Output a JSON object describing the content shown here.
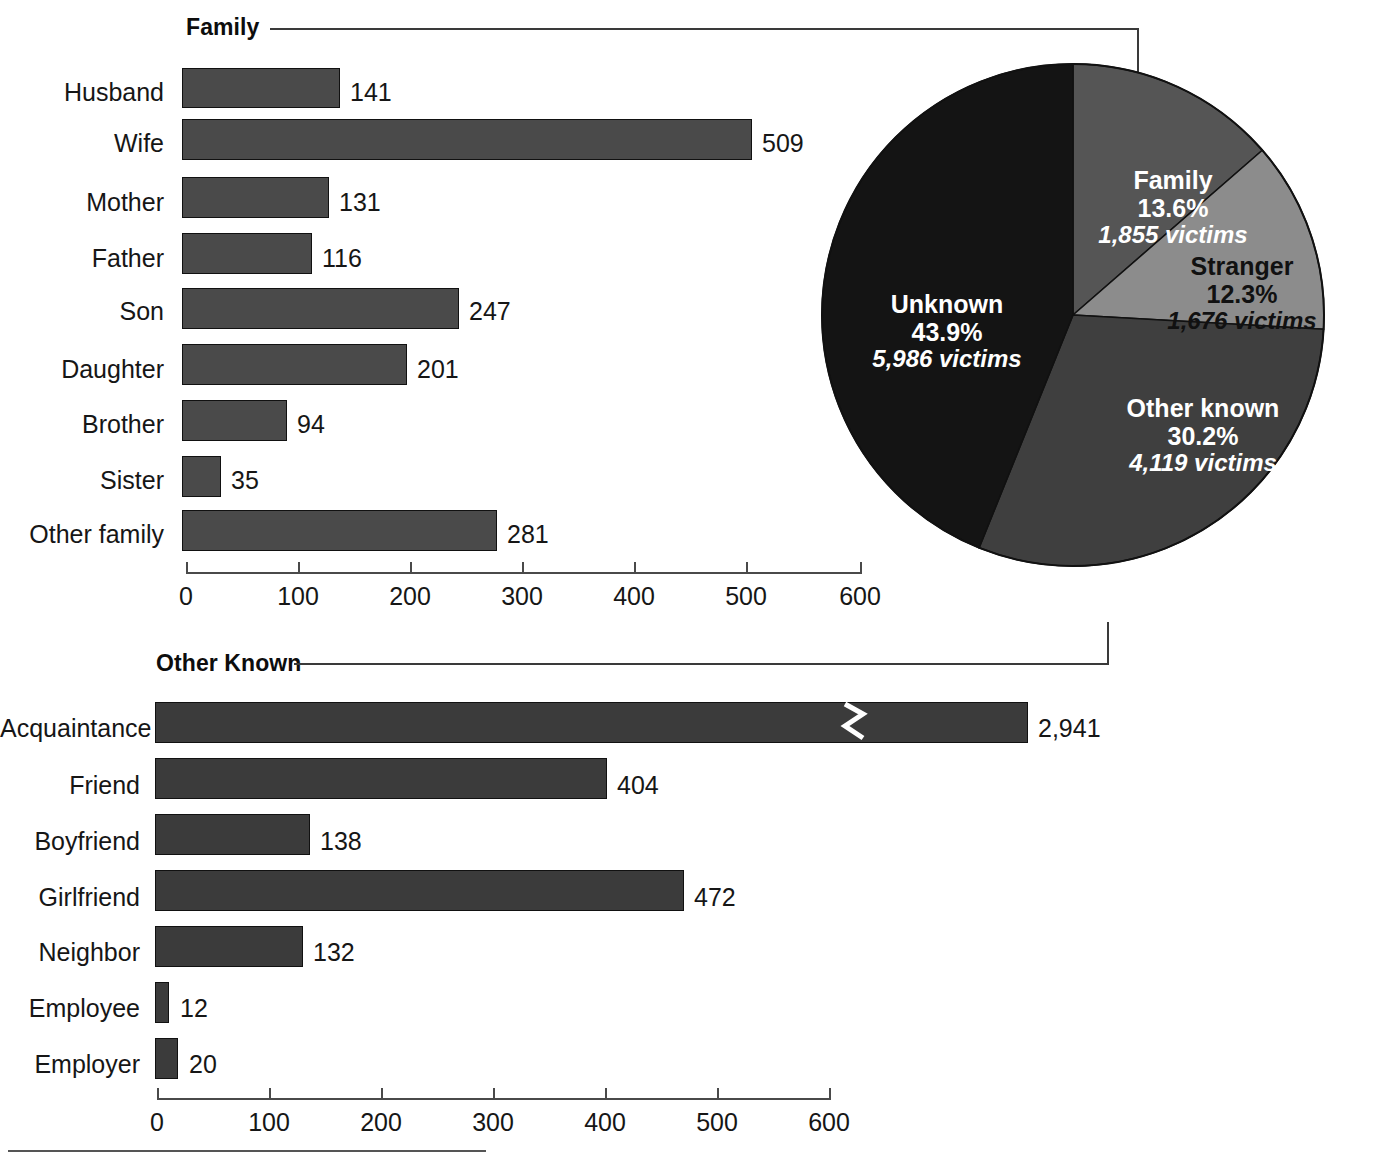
{
  "chart_data": [
    {
      "type": "bar",
      "orientation": "horizontal",
      "title": "Family",
      "categories": [
        "Husband",
        "Wife",
        "Mother",
        "Father",
        "Son",
        "Daughter",
        "Brother",
        "Sister",
        "Other family"
      ],
      "values": [
        141,
        509,
        131,
        116,
        247,
        201,
        94,
        35,
        281
      ],
      "value_labels": [
        "141",
        "509",
        "131",
        "116",
        "247",
        "201",
        "94",
        "35",
        "281"
      ],
      "xlabel": "",
      "ylabel": "",
      "xlim": [
        0,
        600
      ],
      "xticks": [
        0,
        100,
        200,
        300,
        400,
        500,
        600
      ],
      "xtick_labels": [
        "0",
        "100",
        "200",
        "300",
        "400",
        "500",
        "600"
      ],
      "grid": false,
      "legend": "none",
      "bar_color": "#4a4a4a"
    },
    {
      "type": "pie",
      "title": "",
      "categories": [
        "Family",
        "Stranger",
        "Other known",
        "Unknown"
      ],
      "values": [
        13.6,
        12.3,
        30.2,
        43.9
      ],
      "pct_labels": [
        "13.6%",
        "12.3%",
        "30.2%",
        "43.9%"
      ],
      "victim_labels": [
        "1,855 victims",
        "1,676 victims",
        "4,119 victims",
        "5,986 victims"
      ],
      "victim_counts": [
        1855,
        1676,
        4119,
        5986
      ],
      "slice_colors": [
        "#555555",
        "#8c8c8c",
        "#3f3f3f",
        "#141414"
      ],
      "legend": "none",
      "start_angle_deg": 0,
      "direction": "clockwise"
    },
    {
      "type": "bar",
      "orientation": "horizontal",
      "title": "Other Known",
      "categories": [
        "Acquaintance",
        "Friend",
        "Boyfriend",
        "Girlfriend",
        "Neighbor",
        "Employee",
        "Employer"
      ],
      "values": [
        2941,
        404,
        138,
        472,
        132,
        12,
        20
      ],
      "value_labels": [
        "2,941",
        "404",
        "138",
        "472",
        "132",
        "12",
        "20"
      ],
      "xlabel": "",
      "ylabel": "",
      "xlim": [
        0,
        600
      ],
      "xticks": [
        0,
        100,
        200,
        300,
        400,
        500,
        600
      ],
      "xtick_labels": [
        "0",
        "100",
        "200",
        "300",
        "400",
        "500",
        "600"
      ],
      "grid": false,
      "legend": "none",
      "bar_color": "#3b3b3b",
      "axis_break": {
        "series": "Acquaintance",
        "note": "broken bar (value exceeds axis)"
      }
    }
  ],
  "top_chart": {
    "title": "Family",
    "rows": [
      {
        "label": "Husband",
        "value": 141,
        "value_label": "141"
      },
      {
        "label": "Wife",
        "value": 509,
        "value_label": "509"
      },
      {
        "label": "Mother",
        "value": 131,
        "value_label": "131"
      },
      {
        "label": "Father",
        "value": 116,
        "value_label": "116"
      },
      {
        "label": "Son",
        "value": 247,
        "value_label": "247"
      },
      {
        "label": "Daughter",
        "value": 201,
        "value_label": "201"
      },
      {
        "label": "Brother",
        "value": 94,
        "value_label": "94"
      },
      {
        "label": "Sister",
        "value": 35,
        "value_label": "35"
      },
      {
        "label": "Other family",
        "value": 281,
        "value_label": "281"
      }
    ],
    "ticks": [
      "0",
      "100",
      "200",
      "300",
      "400",
      "500",
      "600"
    ]
  },
  "bottom_chart": {
    "title": "Other Known",
    "rows": [
      {
        "label": "Acquaintance",
        "value": 2941,
        "value_label": "2,941"
      },
      {
        "label": "Friend",
        "value": 404,
        "value_label": "404"
      },
      {
        "label": "Boyfriend",
        "value": 138,
        "value_label": "138"
      },
      {
        "label": "Girlfriend",
        "value": 472,
        "value_label": "472"
      },
      {
        "label": "Neighbor",
        "value": 132,
        "value_label": "132"
      },
      {
        "label": "Employee",
        "value": 12,
        "value_label": "12"
      },
      {
        "label": "Employer",
        "value": 20,
        "value_label": "20"
      }
    ],
    "ticks": [
      "0",
      "100",
      "200",
      "300",
      "400",
      "500",
      "600"
    ]
  },
  "pie": {
    "slices": [
      {
        "name": "Family",
        "percent": "13.6%",
        "victims": "1,855 victims"
      },
      {
        "name": "Stranger",
        "percent": "12.3%",
        "victims": "1,676 victims"
      },
      {
        "name": "Other known",
        "percent": "30.2%",
        "victims": "4,119 victims"
      },
      {
        "name": "Unknown",
        "percent": "43.9%",
        "victims": "5,986 victims"
      }
    ]
  },
  "colors": {
    "bar_light": "#4a4a4a",
    "bar_dark": "#3b3b3b",
    "pie_family": "#555555",
    "pie_stranger": "#8c8c8c",
    "pie_other_known": "#3f3f3f",
    "pie_unknown": "#141414",
    "text": "#161616",
    "rule": "#4a4a4a"
  }
}
